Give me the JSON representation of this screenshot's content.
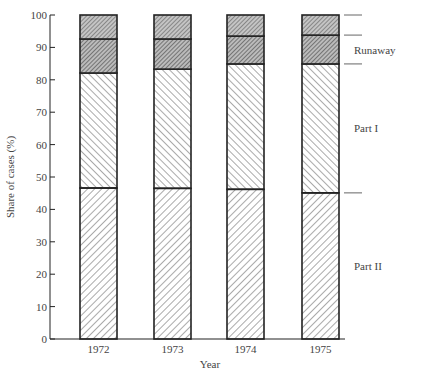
{
  "chart_data": {
    "type": "bar",
    "stacked": true,
    "title": "",
    "xlabel": "Year",
    "ylabel": "Share of cases (%)",
    "ylim": [
      0,
      100
    ],
    "yticks": [
      0,
      10,
      20,
      30,
      40,
      50,
      60,
      70,
      80,
      90,
      100
    ],
    "grid": false,
    "categories": [
      "1972",
      "1973",
      "1974",
      "1975"
    ],
    "series": [
      {
        "name": "Part II",
        "values": [
          46.6,
          46.5,
          46.2,
          45.1
        ],
        "pattern": "hatch-forward"
      },
      {
        "name": "Part I",
        "values": [
          35.5,
          36.8,
          38.7,
          39.8
        ],
        "pattern": "hatch-back"
      },
      {
        "name": "Runaway",
        "values": [
          10.5,
          9.3,
          8.6,
          8.9
        ],
        "pattern": "dense-dark"
      },
      {
        "name": "",
        "values": [
          7.4,
          7.4,
          6.5,
          6.2
        ],
        "pattern": "dense-dark-top"
      }
    ],
    "legend": {
      "position": "right, inline beside last bar",
      "labels": [
        "Runaway",
        "Part I",
        "Part II"
      ]
    }
  },
  "colors": {
    "ink": "#222222",
    "text": "#444444",
    "hatch": "#555555",
    "dense": "#666666"
  }
}
